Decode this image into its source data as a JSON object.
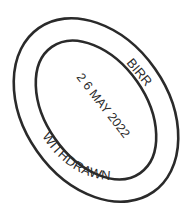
{
  "stamp": {
    "top_text": "BIRR",
    "bottom_text": "WITHDRAWN",
    "date": "2 6 MAY 2022",
    "ink_color": "#2a2a2a",
    "background": "#ffffff"
  }
}
